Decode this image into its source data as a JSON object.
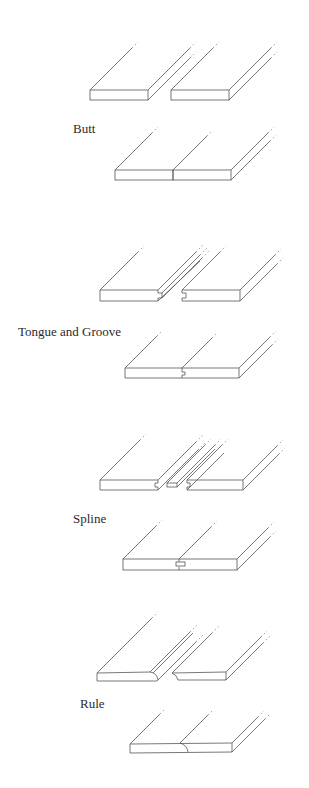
{
  "diagram": {
    "line_color": "#555555",
    "background": "#ffffff",
    "joints": [
      {
        "id": "butt",
        "label": "Butt"
      },
      {
        "id": "tongue-and-groove",
        "label": "Tongue and Groove"
      },
      {
        "id": "spline",
        "label": "Spline"
      },
      {
        "id": "rule",
        "label": "Rule"
      }
    ]
  }
}
